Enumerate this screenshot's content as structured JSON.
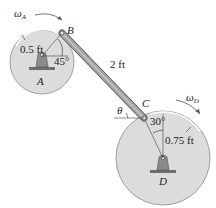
{
  "diagram": {
    "disk_a": {
      "label": "A",
      "radius_label": "0.5 ft",
      "angle_label": "45°",
      "omega_label": "ω",
      "omega_sub": "A"
    },
    "disk_d": {
      "label": "D",
      "radius_label": "0.75 ft",
      "angle_label": "30°",
      "omega_label": "ω",
      "omega_sub": "D"
    },
    "rod": {
      "length_label": "2 ft"
    },
    "points": {
      "b": "B",
      "c": "C"
    },
    "theta_label": "θ",
    "colors": {
      "disk_fill": "#dcdcdc",
      "disk_stroke": "#9a9a9a",
      "rod_fill": "#9e9e9e",
      "rod_stroke": "#555555",
      "support_fill": "#8a8a8a"
    }
  }
}
